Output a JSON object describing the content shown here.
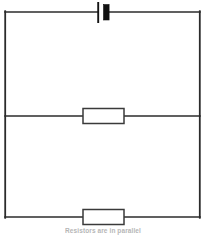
{
  "figure": {
    "caption": "Resistors are in parallel",
    "background_color": "#ffffff",
    "wire_color": "#2b2b2b",
    "component_fill": "#ffffff",
    "battery_color": "#111111",
    "caption_color": "#9a9a9a"
  },
  "circuit": {
    "type": "schematic",
    "description": "Rectangular loop with a battery on the top branch and two resistors on parallel horizontal branches",
    "outer_loop": {
      "left": 5,
      "top": 12,
      "right": 200,
      "bottom": 217,
      "stroke_width": 1.6
    },
    "nodes": [
      {
        "name": "top-left-corner",
        "x": 5,
        "y": 12
      },
      {
        "name": "top-right-corner",
        "x": 200,
        "y": 12
      },
      {
        "name": "bottom-left-corner",
        "x": 5,
        "y": 217
      },
      {
        "name": "bottom-right-corner",
        "x": 200,
        "y": 217
      },
      {
        "name": "left-middle-junction",
        "x": 5,
        "y": 116
      },
      {
        "name": "right-middle-junction",
        "x": 200,
        "y": 116
      }
    ],
    "components": [
      {
        "name": "battery",
        "label": "Battery",
        "symbol": "cell",
        "branch": "top",
        "center_x": 103,
        "center_y": 12,
        "long_plate": {
          "x": 98,
          "y_top": 2,
          "y_bottom": 23,
          "width": 1.6
        },
        "short_plate": {
          "x": 106,
          "y_top": 5,
          "y_bottom": 20,
          "width": 6
        }
      },
      {
        "name": "resistor-1",
        "label": "R1",
        "symbol": "resistor",
        "branch": "middle",
        "x": 83,
        "y": 108,
        "width": 41,
        "height": 15
      },
      {
        "name": "resistor-2",
        "label": "R2",
        "symbol": "resistor",
        "branch": "bottom",
        "x": 83,
        "y": 209,
        "width": 41,
        "height": 15
      }
    ],
    "branches": [
      {
        "name": "top-branch",
        "from": "top-left-corner",
        "to": "top-right-corner",
        "component": "battery"
      },
      {
        "name": "middle-branch",
        "from": "left-middle-junction",
        "to": "right-middle-junction",
        "component": "resistor-1"
      },
      {
        "name": "bottom-branch",
        "from": "bottom-left-corner",
        "to": "bottom-right-corner",
        "component": "resistor-2"
      }
    ]
  }
}
